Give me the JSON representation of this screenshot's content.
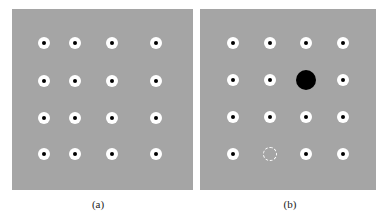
{
  "panels": [
    {
      "id": "a",
      "caption": "(a)",
      "background": "#a5a5a5",
      "box": {
        "x": 12,
        "y": 9,
        "w": 181,
        "h": 181
      },
      "grid": {
        "cols_x": [
          44,
          75,
          112,
          156
        ],
        "rows_y": [
          43,
          81,
          118,
          154
        ]
      },
      "dots": "all 16 white ring markers with black center"
    },
    {
      "id": "b",
      "caption": "(b)",
      "background": "#a5a5a5",
      "box": {
        "x": 200,
        "y": 9,
        "w": 176,
        "h": 181
      },
      "grid": {
        "cols_x": [
          233,
          270,
          306,
          343
        ],
        "rows_y": [
          43,
          80,
          117,
          154
        ]
      },
      "special": [
        {
          "type": "filled-black-circle",
          "row": 1,
          "col": 2
        },
        {
          "type": "dashed-empty-circle",
          "row": 3,
          "col": 1
        }
      ]
    }
  ]
}
